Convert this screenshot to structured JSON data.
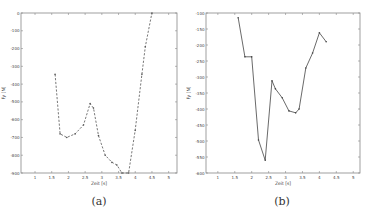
{
  "chart_data": [
    {
      "id": "a",
      "type": "line",
      "caption": "(a)",
      "title": "",
      "xlabel": "Zeit [s]",
      "ylabel": "Fy [N]",
      "xlim": [
        0.58,
        5.25
      ],
      "ylim": [
        -900,
        0
      ],
      "xticks": [
        1,
        1.5,
        2,
        2.5,
        3,
        3.5,
        4,
        4.5,
        5
      ],
      "xtick_labels": [
        "1",
        "1.5",
        "2",
        "2.5",
        "3",
        "3.5",
        "4",
        "4.5",
        "5"
      ],
      "yticks": [
        0,
        -100,
        -200,
        -300,
        -400,
        -500,
        -600,
        -700,
        -800,
        -900
      ],
      "ytick_labels": [
        "0",
        "-100",
        "-200",
        "-300",
        "-400",
        "-500",
        "-600",
        "-700",
        "-800",
        "-900"
      ],
      "grid": false,
      "line_style": "dashed",
      "line_color": "#555555",
      "series": [
        {
          "name": "Fy",
          "x": [
            1.6,
            1.75,
            1.95,
            2.2,
            2.45,
            2.65,
            2.75,
            2.9,
            3.1,
            3.3,
            3.45,
            3.6,
            3.8,
            4.0,
            4.2,
            4.3,
            4.5
          ],
          "y": [
            -345,
            -680,
            -700,
            -680,
            -630,
            -510,
            -535,
            -690,
            -800,
            -840,
            -855,
            -900,
            -900,
            -660,
            -345,
            -190,
            0
          ]
        }
      ]
    },
    {
      "id": "b",
      "type": "line",
      "caption": "(b)",
      "title": "",
      "xlabel": "Zeit [s]",
      "ylabel": "Fy [N]",
      "xlim": [
        0.65,
        5.2
      ],
      "ylim": [
        -600,
        -100
      ],
      "xticks": [
        1,
        1.5,
        2,
        2.5,
        3,
        3.5,
        4,
        4.5,
        5
      ],
      "xtick_labels": [
        "1",
        "1.5",
        "2",
        "2.5",
        "3",
        "3.5",
        "4",
        "4.5",
        "5"
      ],
      "yticks": [
        -100,
        -150,
        -200,
        -250,
        -300,
        -350,
        -400,
        -450,
        -500,
        -550,
        -600
      ],
      "ytick_labels": [
        "-100",
        "-150",
        "-200",
        "-250",
        "-300",
        "-350",
        "-400",
        "-450",
        "-500",
        "-550",
        "-600"
      ],
      "grid": false,
      "line_style": "solid",
      "line_color": "#444444",
      "series": [
        {
          "name": "Fy",
          "x": [
            1.6,
            1.8,
            2.0,
            2.2,
            2.4,
            2.6,
            2.7,
            2.9,
            3.1,
            3.3,
            3.4,
            3.6,
            3.8,
            4.0,
            4.2
          ],
          "y": [
            -115,
            -237,
            -237,
            -497,
            -560,
            -312,
            -337,
            -365,
            -406,
            -412,
            -400,
            -272,
            -225,
            -162,
            -190
          ]
        }
      ]
    }
  ]
}
